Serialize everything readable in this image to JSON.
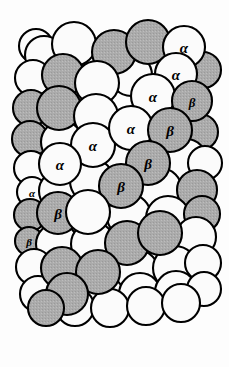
{
  "figure": {
    "name": "close-packed-sphere-stacking-model",
    "background_color": "#fdfdfd",
    "width": 229,
    "height": 367
  },
  "legend": {
    "site_alpha": "α",
    "site_beta": "β"
  },
  "style": {
    "sphere_white_fill": "#fbfbfb",
    "sphere_gray_fill": "#a9a9a9",
    "sphere_gray_fill_light": "#b4b4b4",
    "sphere_outline": "#000000",
    "label_color": "#000000",
    "outline_width": 2.1
  },
  "spheres": [
    {
      "id": "s-r0-c0",
      "cx": 36,
      "cy": 46,
      "r": 17,
      "fill": "white",
      "label": "",
      "layer": "back"
    },
    {
      "id": "s-r0-c1",
      "cx": 44,
      "cy": 55,
      "r": 19,
      "fill": "white",
      "label": "",
      "layer": "back"
    },
    {
      "id": "s-r0-c2",
      "cx": 74,
      "cy": 44,
      "r": 22,
      "fill": "white",
      "label": "",
      "layer": "front"
    },
    {
      "id": "s-r0-c3",
      "cx": 114,
      "cy": 52,
      "r": 22,
      "fill": "gray",
      "label": "",
      "layer": "front"
    },
    {
      "id": "s-r0-c4",
      "cx": 148,
      "cy": 42,
      "r": 22,
      "fill": "gray",
      "label": "",
      "layer": "front"
    },
    {
      "id": "s-r0-c5",
      "cx": 184,
      "cy": 47,
      "r": 21,
      "fill": "white",
      "label": "α",
      "layer": "front"
    },
    {
      "id": "s-r1-c0",
      "cx": 33,
      "cy": 78,
      "r": 18,
      "fill": "white",
      "label": "",
      "layer": "back"
    },
    {
      "id": "s-r1-c1",
      "cx": 63,
      "cy": 75,
      "r": 21,
      "fill": "gray",
      "label": "",
      "layer": "front"
    },
    {
      "id": "s-r1-c2",
      "cx": 97,
      "cy": 83,
      "r": 22,
      "fill": "white",
      "label": "",
      "layer": "front"
    },
    {
      "id": "s-r1-c3",
      "cx": 131,
      "cy": 75,
      "r": 21,
      "fill": "white",
      "label": "",
      "layer": "back"
    },
    {
      "id": "s-r1-c4",
      "cx": 176,
      "cy": 74,
      "r": 21,
      "fill": "white",
      "label": "α",
      "layer": "front"
    },
    {
      "id": "s-r1-c5",
      "cx": 203,
      "cy": 70,
      "r": 18,
      "fill": "gray",
      "label": "",
      "layer": "back"
    },
    {
      "id": "s-r2-c0",
      "cx": 31,
      "cy": 108,
      "r": 18,
      "fill": "gray",
      "label": "",
      "layer": "back"
    },
    {
      "id": "s-r2-c1",
      "cx": 59,
      "cy": 108,
      "r": 22,
      "fill": "gray",
      "label": "",
      "layer": "front"
    },
    {
      "id": "s-r2-c2",
      "cx": 96,
      "cy": 116,
      "r": 22,
      "fill": "white",
      "label": "",
      "layer": "front"
    },
    {
      "id": "s-r2-c3",
      "cx": 153,
      "cy": 96,
      "r": 22,
      "fill": "white",
      "label": "α",
      "layer": "front"
    },
    {
      "id": "s-r2-c4",
      "cx": 192,
      "cy": 101,
      "r": 20,
      "fill": "gray",
      "label": "β",
      "layer": "front"
    },
    {
      "id": "s-r3-c0",
      "cx": 30,
      "cy": 139,
      "r": 18,
      "fill": "gray",
      "label": "",
      "layer": "back"
    },
    {
      "id": "s-r3-c1",
      "cx": 62,
      "cy": 142,
      "r": 21,
      "fill": "white",
      "label": "",
      "layer": "back"
    },
    {
      "id": "s-r3-c2",
      "cx": 93,
      "cy": 145,
      "r": 22,
      "fill": "white",
      "label": "α",
      "layer": "front"
    },
    {
      "id": "s-r3-c3",
      "cx": 131,
      "cy": 128,
      "r": 22,
      "fill": "white",
      "label": "α",
      "layer": "front"
    },
    {
      "id": "s-r3-c4",
      "cx": 170,
      "cy": 130,
      "r": 22,
      "fill": "gray",
      "label": "β",
      "layer": "front"
    },
    {
      "id": "s-r3-c5",
      "cx": 200,
      "cy": 132,
      "r": 18,
      "fill": "gray",
      "label": "",
      "layer": "back"
    },
    {
      "id": "s-r4-c0",
      "cx": 31,
      "cy": 168,
      "r": 17,
      "fill": "white",
      "label": "",
      "layer": "back"
    },
    {
      "id": "s-r4-c1",
      "cx": 60,
      "cy": 164,
      "r": 21,
      "fill": "white",
      "label": "α",
      "layer": "front"
    },
    {
      "id": "s-r4-c2",
      "cx": 110,
      "cy": 159,
      "r": 22,
      "fill": "white",
      "label": "",
      "layer": "back"
    },
    {
      "id": "s-r4-c3",
      "cx": 148,
      "cy": 163,
      "r": 22,
      "fill": "gray",
      "label": "β",
      "layer": "front"
    },
    {
      "id": "s-r4-c4",
      "cx": 186,
      "cy": 160,
      "r": 21,
      "fill": "white",
      "label": "",
      "layer": "back"
    },
    {
      "id": "s-r4-c5",
      "cx": 205,
      "cy": 163,
      "r": 17,
      "fill": "white",
      "label": "",
      "layer": "back"
    },
    {
      "id": "s-r5-c0",
      "cx": 32,
      "cy": 192,
      "r": 15,
      "fill": "white",
      "label": "α",
      "layer": "back"
    },
    {
      "id": "s-r5-c1",
      "cx": 59,
      "cy": 191,
      "r": 20,
      "fill": "white",
      "label": "",
      "layer": "back"
    },
    {
      "id": "s-r5-c2",
      "cx": 92,
      "cy": 181,
      "r": 22,
      "fill": "white",
      "label": "",
      "layer": "back"
    },
    {
      "id": "s-r5-c3",
      "cx": 121,
      "cy": 186,
      "r": 22,
      "fill": "gray",
      "label": "β",
      "layer": "front"
    },
    {
      "id": "s-r5-c4",
      "cx": 160,
      "cy": 190,
      "r": 22,
      "fill": "white",
      "label": "",
      "layer": "back"
    },
    {
      "id": "s-r5-c5",
      "cx": 197,
      "cy": 190,
      "r": 20,
      "fill": "gray",
      "label": "",
      "layer": "back"
    },
    {
      "id": "s-r6-c0",
      "cx": 30,
      "cy": 215,
      "r": 16,
      "fill": "gray",
      "label": "",
      "layer": "back"
    },
    {
      "id": "s-r6-c1",
      "cx": 58,
      "cy": 213,
      "r": 21,
      "fill": "gray",
      "label": "β",
      "layer": "front"
    },
    {
      "id": "s-r6-c2",
      "cx": 88,
      "cy": 212,
      "r": 22,
      "fill": "white",
      "label": "",
      "layer": "front"
    },
    {
      "id": "s-r6-c3",
      "cx": 129,
      "cy": 216,
      "r": 22,
      "fill": "white",
      "label": "",
      "layer": "back"
    },
    {
      "id": "s-r6-c4",
      "cx": 168,
      "cy": 218,
      "r": 22,
      "fill": "white",
      "label": "",
      "layer": "back"
    },
    {
      "id": "s-r6-c5",
      "cx": 202,
      "cy": 214,
      "r": 18,
      "fill": "gray",
      "label": "",
      "layer": "back"
    },
    {
      "id": "s-r7-c0",
      "cx": 29,
      "cy": 241,
      "r": 14,
      "fill": "gray",
      "label": "β",
      "layer": "back"
    },
    {
      "id": "s-r7-c1",
      "cx": 57,
      "cy": 244,
      "r": 21,
      "fill": "white",
      "label": "",
      "layer": "back"
    },
    {
      "id": "s-r7-c2",
      "cx": 93,
      "cy": 244,
      "r": 22,
      "fill": "white",
      "label": "",
      "layer": "back"
    },
    {
      "id": "s-r7-c3",
      "cx": 127,
      "cy": 243,
      "r": 22,
      "fill": "gray",
      "label": "",
      "layer": "front"
    },
    {
      "id": "s-r7-c4",
      "cx": 160,
      "cy": 233,
      "r": 22,
      "fill": "gray",
      "label": "",
      "layer": "front"
    },
    {
      "id": "s-r7-c5",
      "cx": 196,
      "cy": 237,
      "r": 20,
      "fill": "white",
      "label": "",
      "layer": "back"
    },
    {
      "id": "s-r8-c0",
      "cx": 34,
      "cy": 267,
      "r": 18,
      "fill": "white",
      "label": "",
      "layer": "back"
    },
    {
      "id": "s-r8-c1",
      "cx": 62,
      "cy": 268,
      "r": 21,
      "fill": "gray",
      "label": "",
      "layer": "front"
    },
    {
      "id": "s-r8-c2",
      "cx": 98,
      "cy": 272,
      "r": 22,
      "fill": "gray",
      "label": "",
      "layer": "front"
    },
    {
      "id": "s-r8-c3",
      "cx": 137,
      "cy": 272,
      "r": 22,
      "fill": "white",
      "label": "",
      "layer": "back"
    },
    {
      "id": "s-r8-c4",
      "cx": 175,
      "cy": 268,
      "r": 22,
      "fill": "white",
      "label": "",
      "layer": "back"
    },
    {
      "id": "s-r8-c5",
      "cx": 203,
      "cy": 263,
      "r": 18,
      "fill": "white",
      "label": "",
      "layer": "back"
    },
    {
      "id": "s-r9-c0",
      "cx": 38,
      "cy": 294,
      "r": 18,
      "fill": "white",
      "label": "",
      "layer": "back"
    },
    {
      "id": "s-r9-c1",
      "cx": 67,
      "cy": 294,
      "r": 21,
      "fill": "gray",
      "label": "",
      "layer": "front"
    },
    {
      "id": "s-r9-c2",
      "cx": 103,
      "cy": 296,
      "r": 21,
      "fill": "white",
      "label": "",
      "layer": "back"
    },
    {
      "id": "s-r9-c3",
      "cx": 140,
      "cy": 294,
      "r": 21,
      "fill": "white",
      "label": "",
      "layer": "back"
    },
    {
      "id": "s-r9-c4",
      "cx": 176,
      "cy": 292,
      "r": 21,
      "fill": "white",
      "label": "",
      "layer": "back"
    },
    {
      "id": "s-r9-c5",
      "cx": 204,
      "cy": 289,
      "r": 17,
      "fill": "white",
      "label": "",
      "layer": "back"
    },
    {
      "id": "s-r10-c0",
      "cx": 46,
      "cy": 308,
      "r": 18,
      "fill": "gray",
      "label": "",
      "layer": "front"
    },
    {
      "id": "s-r10-c1",
      "cx": 75,
      "cy": 307,
      "r": 19,
      "fill": "white",
      "label": "",
      "layer": "back"
    },
    {
      "id": "s-r10-c2",
      "cx": 110,
      "cy": 308,
      "r": 19,
      "fill": "white",
      "label": "",
      "layer": "back"
    },
    {
      "id": "s-r10-c3",
      "cx": 146,
      "cy": 306,
      "r": 19,
      "fill": "white",
      "label": "",
      "layer": "back"
    },
    {
      "id": "s-r10-c4",
      "cx": 181,
      "cy": 303,
      "r": 19,
      "fill": "white",
      "label": "",
      "layer": "back"
    }
  ],
  "label_sizes": {
    "small": 11,
    "medium": 13,
    "large": 15
  }
}
